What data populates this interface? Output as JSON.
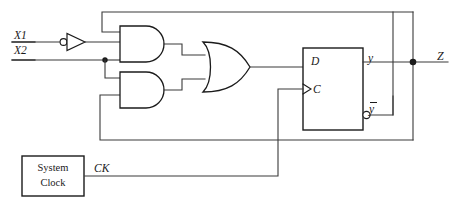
{
  "diagram": {
    "stroke_color": "#3a3a3a",
    "stroke_color_dark": "#1b1b1b",
    "background": "#ffffff"
  },
  "inputs": [
    {
      "name": "input-x1",
      "label": "X1"
    },
    {
      "name": "input-x2",
      "label": "X2"
    }
  ],
  "gates": {
    "inverter": {
      "label": "",
      "icon": "not-gate-icon"
    },
    "and_top": {
      "label": "",
      "icon": "and-gate-icon"
    },
    "and_bottom": {
      "label": "",
      "icon": "and-gate-icon"
    },
    "or": {
      "label": "",
      "icon": "or-gate-icon"
    }
  },
  "flipflop": {
    "type": "D flip-flop",
    "d_label": "D",
    "c_label": "C",
    "q_label": "y",
    "qbar_label": "y"
  },
  "clock": {
    "line1": "System",
    "line2": "Clock",
    "signal_label": "CK"
  },
  "outputs": [
    {
      "name": "output-z",
      "label": "Z"
    }
  ]
}
